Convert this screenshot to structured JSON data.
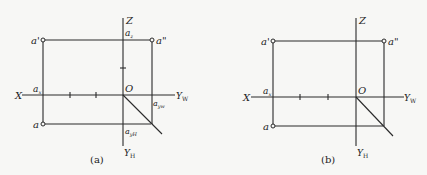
{
  "figures": [
    {
      "id": "a",
      "caption": "(a)",
      "labels": {
        "z": "Z",
        "x": "X",
        "o": "O",
        "yw": "Y",
        "yw_sub": "W",
        "yh": "Y",
        "yh_sub": "H",
        "a_front": "a'",
        "a_side": "a\"",
        "a_top": "a",
        "az": "a",
        "az_sub": "z",
        "ax": "a",
        "ax_sub": "x",
        "ayw": "a",
        "ayw_sub": "yw",
        "ayh": "a",
        "ayh_sub": "yH"
      }
    },
    {
      "id": "b",
      "caption": "(b)",
      "labels": {
        "z": "Z",
        "x": "X",
        "o": "O",
        "yw": "Y",
        "yw_sub": "W",
        "yh": "Y",
        "yh_sub": "H",
        "a_front": "a'",
        "a_side": "a\"",
        "a_top": "a",
        "ax": "a",
        "ax_sub": "x"
      }
    }
  ]
}
